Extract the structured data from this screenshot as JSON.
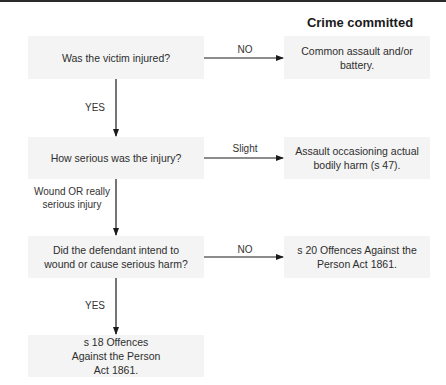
{
  "heading": "Crime committed",
  "questions": [
    {
      "text": "Was the victim injured?"
    },
    {
      "text": "How serious was the injury?"
    },
    {
      "text": "Did the defendant intend to wound or cause serious harm?"
    },
    {
      "text": "s 18 Offences Against the Person Act 1861."
    }
  ],
  "outcomes": [
    {
      "text": "Common assault and/or battery."
    },
    {
      "text": "Assault occasioning actual bodily harm (s 47)."
    },
    {
      "text": "s 20 Offences Against the Person Act 1861."
    }
  ],
  "edge_labels": {
    "q1_no": "NO",
    "q1_yes": "YES",
    "q2_slight": "Slight",
    "q2_serious": "Wound OR really serious injury",
    "q3_no": "NO",
    "q3_yes": "YES"
  },
  "colors": {
    "box_fill": "#f4f4f4",
    "line": "#1a1a1a",
    "top_border": "#2b2b2b"
  }
}
